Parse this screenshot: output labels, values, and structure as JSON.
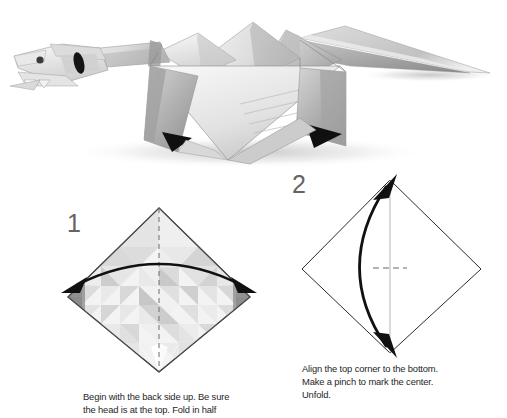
{
  "page": {
    "background_color": "#ffffff",
    "width": 507,
    "height": 418
  },
  "photo": {
    "name": "origami-dragon-photo",
    "subject": "Completed origami dragon model",
    "description": "Folded paper dragon with long head, wings and tail, shown in grayscale on a white background with a soft drop shadow",
    "paper_colors": {
      "light": "#f4f4f4",
      "mid": "#d8d8d8",
      "shade": "#a8a8a8",
      "dark": "#7c7c7c",
      "accent_dark": "#111111"
    }
  },
  "steps": [
    {
      "number": "1",
      "number_color": "#646464",
      "diagram_name": "square-back-side-up-with-triangle-tessellation",
      "fold_line": "vertical dashed valley fold through the center",
      "arrow": "double-headed curved arrow across the square",
      "caption": "Begin with the back side up. Be sure\nthe head is at the top. Fold in half"
    },
    {
      "number": "2",
      "number_color": "#646464",
      "diagram_name": "square-plain-with-center-pinch-mark",
      "fold_line": "vertical light gray center line with a dashed pinch tick at the middle",
      "arrow": "double-headed curved arrow from the top corner to the bottom corner",
      "caption": "Align the top corner to the bottom.\nMake a pinch to mark the center.\nUnfold."
    }
  ]
}
